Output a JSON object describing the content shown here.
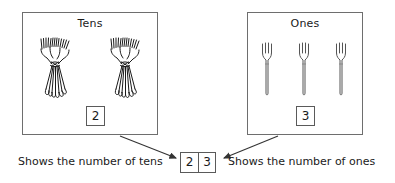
{
  "diagram": {
    "title_hidden": "",
    "groups": [
      {
        "id": "tens",
        "title": "Tens",
        "digit": "2",
        "object_count": 2,
        "object_kind": "bundle-of-ten-forks"
      },
      {
        "id": "ones",
        "title": "Ones",
        "digit": "3",
        "object_count": 3,
        "object_kind": "single-fork"
      }
    ],
    "answer": {
      "tens_digit": "2",
      "ones_digit": "3"
    },
    "captions": {
      "left": "Shows the number of tens",
      "right": "Shows the number of ones"
    },
    "icons": {
      "bundle": "fork-bundle-icon",
      "fork": "fork-icon",
      "arrow_left": "arrow-down-right-icon",
      "arrow_right": "arrow-down-left-icon"
    },
    "colors": {
      "background": "#ffffff",
      "box_border": "#6e6e6e",
      "chip_border": "#5a5a5a",
      "ink": "#1a1a1a",
      "line": "#333333"
    }
  }
}
